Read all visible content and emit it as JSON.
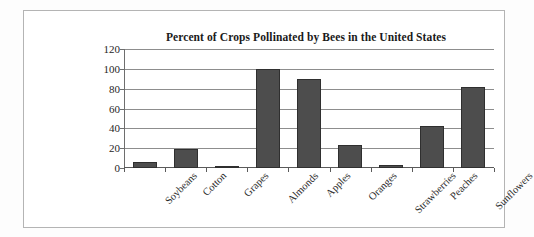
{
  "chart_data": {
    "type": "bar",
    "title": "Percent of Crops Pollinated by Bees in the United States",
    "xlabel": "",
    "ylabel": "",
    "categories": [
      "Soybeans",
      "Cotton",
      "Grapes",
      "Almonds",
      "Apples",
      "Oranges",
      "Strawberries",
      "Peaches",
      "Sunflowers"
    ],
    "values": [
      6,
      19,
      2,
      100,
      90,
      23,
      3,
      42,
      82
    ],
    "ylim": [
      0,
      120
    ],
    "yticks": [
      0,
      20,
      40,
      60,
      80,
      100,
      120
    ],
    "ytick_labels": [
      "0",
      "20",
      "40",
      "60",
      "80",
      "100",
      "120"
    ],
    "grid": true,
    "legend": false,
    "bar_color": "#4d4d4d",
    "bar_edge_color": "#2f2f2f",
    "gridline_color": "#8d8d8d",
    "axis_color": "#5a5a5a",
    "plot_background": "#ffffff",
    "frame_border_color": "#b4b4b4"
  }
}
